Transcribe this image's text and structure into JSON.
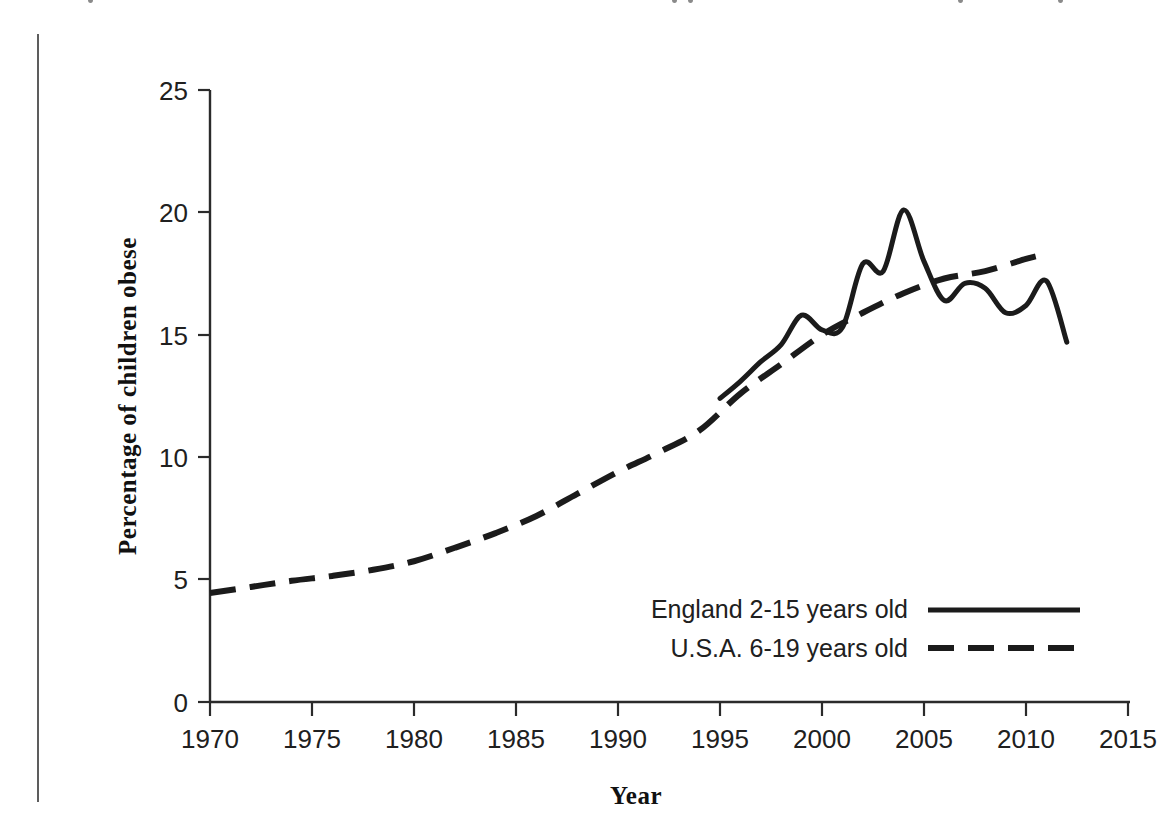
{
  "figure": {
    "background_color": "#ffffff",
    "ink_color": "#1b1b1b",
    "scan_artifact_name": "vertical-margin-rule"
  },
  "chart_data": {
    "type": "line",
    "title": "",
    "xlabel": "Year",
    "ylabel": "Percentage of children obese",
    "xlim": [
      1970,
      2015
    ],
    "ylim": [
      0,
      25
    ],
    "xticks": [
      1970,
      1975,
      1980,
      1985,
      1990,
      1995,
      2000,
      2005,
      2010,
      2015
    ],
    "yticks": [
      0,
      5,
      10,
      15,
      20,
      25
    ],
    "xtick_labels": [
      "1970",
      "1975",
      "1980",
      "1985",
      "1990",
      "1995",
      "2000",
      "2005",
      "2010",
      "2015"
    ],
    "ytick_labels": [
      "0",
      "5",
      "10",
      "15",
      "20",
      "25"
    ],
    "grid": false,
    "legend_position": "inside lower-right",
    "series": [
      {
        "name": "England 2-15 years old",
        "style": "solid",
        "color": "#1b1b1b",
        "x": [
          1995,
          1996,
          1997,
          1998,
          1999,
          2000,
          2001,
          2002,
          2003,
          2004,
          2005,
          2006,
          2007,
          2008,
          2009,
          2010,
          2011,
          2012
        ],
        "y": [
          12.4,
          13.1,
          13.9,
          14.6,
          15.8,
          15.2,
          15.3,
          17.9,
          17.6,
          20.1,
          18.0,
          16.4,
          17.1,
          16.9,
          15.9,
          16.2,
          17.2,
          14.7
        ]
      },
      {
        "name": "U.S.A. 6-19 years old",
        "style": "dashed",
        "color": "#1b1b1b",
        "x": [
          1970,
          1972,
          1974,
          1976,
          1978,
          1980,
          1982,
          1984,
          1986,
          1988,
          1990,
          1992,
          1994,
          1996,
          1998,
          2000,
          2002,
          2004,
          2006,
          2008,
          2010,
          2011
        ],
        "y": [
          4.45,
          4.7,
          4.95,
          5.15,
          5.4,
          5.75,
          6.3,
          6.9,
          7.6,
          8.5,
          9.4,
          10.2,
          11.1,
          12.6,
          13.8,
          15.0,
          15.9,
          16.7,
          17.3,
          17.6,
          18.1,
          18.3
        ]
      }
    ]
  },
  "legend": {
    "entries": [
      {
        "label": "England 2-15 years old",
        "style": "solid"
      },
      {
        "label": "U.S.A. 6-19 years old",
        "style": "dashed"
      }
    ]
  }
}
